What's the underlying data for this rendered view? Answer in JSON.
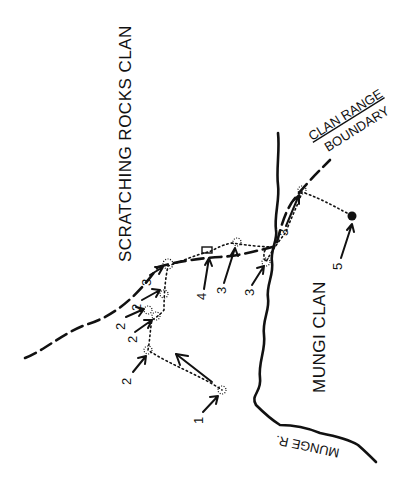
{
  "map": {
    "regions": {
      "scratching_rocks_clan": "SCRATCHING  ROCKS  CLAN",
      "mungi_clan": "MUNGI   CLAN"
    },
    "features": {
      "clan_range_label": "CLAN RANGE",
      "boundary_label": "BOUNDARY",
      "river_label": "MUNGE R."
    },
    "site_labels": [
      {
        "id": "site-1",
        "label": "1"
      },
      {
        "id": "site-2a",
        "label": "2"
      },
      {
        "id": "site-2b",
        "label": "2"
      },
      {
        "id": "site-2c",
        "label": "2"
      },
      {
        "id": "site-2d",
        "label": "2"
      },
      {
        "id": "site-3a",
        "label": "3"
      },
      {
        "id": "site-4",
        "label": "4"
      },
      {
        "id": "site-3b",
        "label": "3"
      },
      {
        "id": "site-3c",
        "label": "3"
      },
      {
        "id": "site-3d",
        "label": "3"
      },
      {
        "id": "site-5",
        "label": "5"
      }
    ],
    "colors": {
      "ink": "#111111",
      "background": "#ffffff"
    }
  }
}
